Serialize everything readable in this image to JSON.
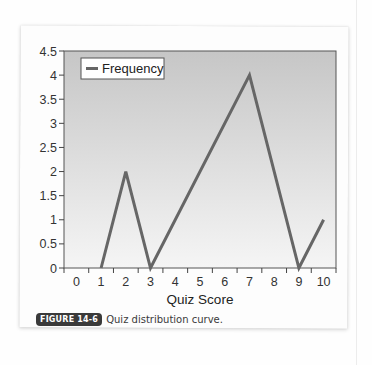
{
  "figure": {
    "badge": "FIGURE 14-6",
    "caption": "Quiz distribution curve."
  },
  "chart_data": {
    "type": "line",
    "title": "",
    "xlabel": "Quiz Score",
    "ylabel": "",
    "categories": [
      "0",
      "1",
      "2",
      "3",
      "4",
      "5",
      "6",
      "7",
      "8",
      "9",
      "10"
    ],
    "x": [
      1,
      2,
      3,
      7,
      9,
      10
    ],
    "series": [
      {
        "name": "Frequency",
        "x": [
          1,
          2,
          3,
          7,
          9,
          10
        ],
        "values": [
          0,
          2,
          0,
          4,
          0,
          1
        ],
        "color": "#666666"
      }
    ],
    "yticks": [
      "0",
      "0.5",
      "1",
      "1.5",
      "2",
      "2.5",
      "3",
      "3.5",
      "4",
      "4.5"
    ],
    "ylim": [
      0,
      4.5
    ],
    "xlim": [
      0,
      10
    ],
    "grid": false,
    "legend": {
      "position": "top-left",
      "entries": [
        "Frequency"
      ]
    },
    "background": "gradient gray (#c8c8c8 top to #f4f4f4 bottom)"
  }
}
